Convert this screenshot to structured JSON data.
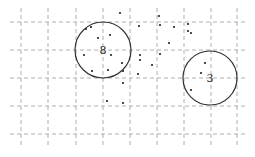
{
  "diagram": {
    "type": "cluster-scatter",
    "width": 255,
    "height": 157,
    "colors": {
      "grid": "#9a9a9a",
      "circle": "#333333",
      "point": "#222222",
      "label": "#222222"
    },
    "grid": {
      "vertical_x": [
        21,
        48,
        76,
        103,
        130,
        157,
        184,
        211,
        237
      ],
      "horizontal_y": [
        22,
        50,
        78,
        106,
        134
      ],
      "x_extent": [
        10,
        248
      ],
      "y_extent": [
        8,
        146
      ]
    },
    "clusters": [
      {
        "label": "8",
        "cx": 103,
        "cy": 50,
        "r": 28
      },
      {
        "label": "3",
        "cx": 210,
        "cy": 78,
        "r": 27
      }
    ],
    "points": [
      [
        120,
        13
      ],
      [
        159,
        16
      ],
      [
        139,
        26
      ],
      [
        160,
        25
      ],
      [
        174,
        27
      ],
      [
        188,
        24
      ],
      [
        188,
        31
      ],
      [
        191,
        33
      ],
      [
        86,
        29
      ],
      [
        91,
        27
      ],
      [
        98,
        38
      ],
      [
        110,
        35
      ],
      [
        169,
        43
      ],
      [
        84,
        55
      ],
      [
        140,
        55
      ],
      [
        111,
        55
      ],
      [
        160,
        54
      ],
      [
        140,
        60
      ],
      [
        152,
        65
      ],
      [
        122,
        63
      ],
      [
        92,
        71
      ],
      [
        108,
        70
      ],
      [
        123,
        71
      ],
      [
        138,
        74
      ],
      [
        123,
        83
      ],
      [
        107,
        101
      ],
      [
        123,
        103
      ],
      [
        205,
        63
      ],
      [
        201,
        73
      ],
      [
        191,
        90
      ]
    ]
  }
}
